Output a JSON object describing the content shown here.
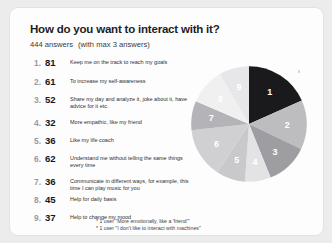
{
  "card": {
    "title": "How do you want to interact with it?",
    "answers_text": "444 answers",
    "max_note": "(with max 3 answers)"
  },
  "items": [
    {
      "rank": "1.",
      "count": "81",
      "label": "Keep me on the track to reach my goals"
    },
    {
      "rank": "2.",
      "count": "61",
      "label": "To increase my self-awareness"
    },
    {
      "rank": "3.",
      "count": "52",
      "label": "Share my day and analyze it, joke about it, have advice for it etc."
    },
    {
      "rank": "4.",
      "count": "32",
      "label": "More empathic, like my friend"
    },
    {
      "rank": "5.",
      "count": "36",
      "label": "Like my life coach"
    },
    {
      "rank": "6.",
      "count": "62",
      "label": "Understand me without telling the same things every time"
    },
    {
      "rank": "7.",
      "count": "36",
      "label": "Communicate in different ways, for example, this time I can play music for you"
    },
    {
      "rank": "8.",
      "count": "45",
      "label": "Help for daily basis"
    },
    {
      "rank": "9.",
      "count": "37",
      "label": "Help to change my mood"
    }
  ],
  "footnotes": [
    "* 1 user \"More emotionally, like a 'friend'\"",
    "* 1 user \"I don't like to interact with machines\""
  ],
  "chart_data": {
    "type": "pie",
    "title": "How do you want to interact with it?",
    "categories": [
      "Keep me on the track to reach my goals",
      "To increase my self-awareness",
      "Share my day and analyze it, joke about it, have advice for it etc.",
      "More empathic, like my friend",
      "Like my life coach",
      "Understand me without telling the same things every time",
      "Communicate in different ways, for example, this time I can play music for you",
      "Help for daily basis",
      "Help to change my mood"
    ],
    "slice_labels": [
      "1",
      "2",
      "3",
      "4",
      "5",
      "6",
      "7",
      "8",
      "9"
    ],
    "values": [
      81,
      61,
      52,
      32,
      36,
      62,
      36,
      45,
      37
    ],
    "total": 442,
    "start_angle_deg": 0,
    "direction": "clockwise",
    "legend": "none",
    "colors": [
      "#1a1a1c",
      "#bdbdc0",
      "#9e9ea2",
      "#e3e3e5",
      "#c9c9cc",
      "#d0d0d3",
      "#b4b4b8",
      "#f0f0f1",
      "#e7e7e9"
    ]
  },
  "colors": {
    "page_background": "#ececed",
    "card_background": "#fdfdfd",
    "card_border": "#e2e2e4",
    "title_text": "#1d1d1f",
    "count_text": "#17171a",
    "rank_text": "#9a9aa0",
    "label_text": "#2e2e33"
  }
}
